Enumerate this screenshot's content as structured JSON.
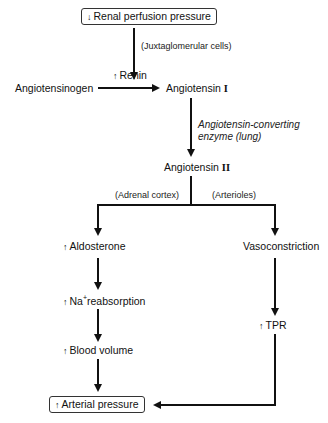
{
  "diagram": {
    "nodes": {
      "renal_perfusion": {
        "indicator": "↓",
        "text": "Renal perfusion pressure"
      },
      "renin": {
        "indicator": "↑",
        "text": "Renin"
      },
      "angiotensinogen": {
        "text": "Angiotensinogen"
      },
      "angiotensin_1": {
        "text": "Angiotensin",
        "numeral": "I"
      },
      "angiotensin_2": {
        "text": "Angiotensin",
        "numeral": "II"
      },
      "aldosterone": {
        "indicator": "↑",
        "text": "Aldosterone"
      },
      "na_reabsorption": {
        "indicator": "↑",
        "prefix": "Na",
        "sup": "+",
        "text": "reabsorption"
      },
      "blood_volume": {
        "indicator": "↑",
        "text": "Blood volume"
      },
      "vasoconstriction": {
        "text": "Vasoconstriction"
      },
      "tpr": {
        "indicator": "↑",
        "text": "TPR"
      },
      "arterial_pressure": {
        "indicator": "↑",
        "text": "Arterial pressure"
      }
    },
    "edge_labels": {
      "juxtaglomerular": "(Juxtaglomerular cells)",
      "ace_line1": "Angiotensin-converting",
      "ace_line2": "enzyme (lung)",
      "adrenal_cortex": "(Adrenal cortex)",
      "arterioles": "(Arterioles)"
    },
    "colors": {
      "line": "#111111",
      "background": "#ffffff"
    }
  }
}
